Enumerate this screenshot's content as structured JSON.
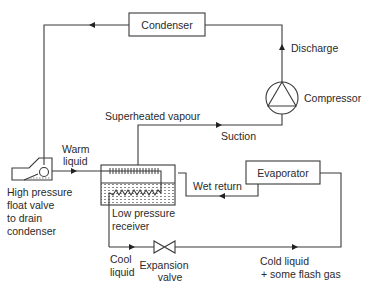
{
  "diagram": {
    "type": "refrigeration-flow-diagram",
    "components": {
      "condenser": "Condenser",
      "compressor": "Compressor",
      "evaporator": "Evaporator",
      "receiver": [
        "Low pressure",
        "receiver"
      ],
      "float_valve": [
        "High pressure",
        "float valve",
        "to drain",
        "condenser"
      ],
      "expansion_valve": [
        "Expansion",
        "valve"
      ]
    },
    "flow_labels": {
      "discharge": "Discharge",
      "superheated_vapour": "Superheated vapour",
      "suction": "Suction",
      "warm_liquid": [
        "Warm",
        "liquid"
      ],
      "wet_return": "Wet return",
      "cool_liquid": [
        "Cool",
        "liquid"
      ],
      "cold_liquid": [
        "Cold liquid",
        "+ some flash gas"
      ]
    },
    "colors": {
      "line": "#3a3a3a",
      "text": "#2a2a2a",
      "background": "#ffffff"
    }
  }
}
